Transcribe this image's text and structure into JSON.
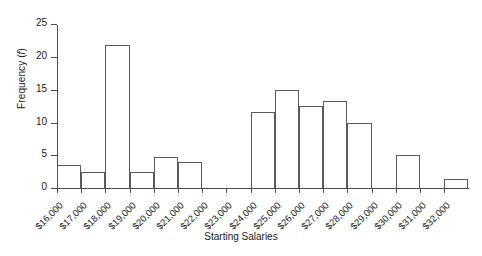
{
  "chart_data": {
    "type": "bar",
    "title": "",
    "xlabel": "Starting Salaries",
    "ylabel": "Frequency (f)",
    "ylabel_plain": "Frequency",
    "ylabel_symbol": "f",
    "categories": [
      "$16,000",
      "$17,000",
      "$18,000",
      "$19,000",
      "$20,000",
      "$21,000",
      "$22,000",
      "$23,000",
      "$24,000",
      "$25,000",
      "$26,000",
      "$27,000",
      "$28,000",
      "$29,000",
      "$30,000",
      "$31,000",
      "$32,000"
    ],
    "values": [
      3.5,
      2.5,
      21.8,
      2.5,
      4.8,
      4,
      0,
      0,
      11.6,
      15,
      12.5,
      13.3,
      10,
      0,
      5,
      0,
      1.4
    ],
    "ylim": [
      0,
      26.5
    ],
    "yticks": [
      0,
      5,
      10,
      15,
      20,
      25
    ],
    "ytick_labels": [
      "0",
      "5",
      "10",
      "15",
      "20",
      "25"
    ],
    "grid": false,
    "legend": false,
    "bar_fill": "#ffffff",
    "bar_edge": "#595959",
    "axis_color": "#4d4d4d"
  }
}
